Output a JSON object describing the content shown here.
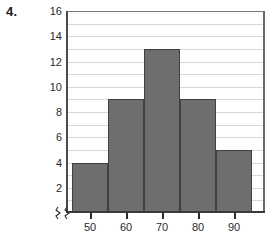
{
  "problem": {
    "number": "4."
  },
  "chart_data": {
    "type": "bar",
    "title": "",
    "xlabel": "",
    "ylabel": "",
    "categories": [
      "50",
      "60",
      "70",
      "80",
      "90"
    ],
    "values": [
      4,
      9,
      13,
      9,
      5
    ],
    "ylim": [
      0,
      16
    ],
    "y_ticks": [
      16,
      14,
      12,
      10,
      8,
      6,
      4,
      2
    ],
    "y_tick_labels": [
      "16",
      "14",
      "12",
      "10",
      "8",
      "6",
      "4",
      "2"
    ],
    "x_tick_labels": [
      "50",
      "60",
      "70",
      "80",
      "90"
    ],
    "grid": true,
    "grid_interval": 1,
    "legend": "none",
    "bar_color": "#6e6e6e",
    "bar_edge_color": "#3f3f3f",
    "grid_color": "#d8d8d8",
    "axis_color": "#3a3a3a",
    "axis_break": true,
    "bars": [
      {
        "label": "50",
        "value": 4
      },
      {
        "label": "60",
        "value": 9
      },
      {
        "label": "70",
        "value": 13
      },
      {
        "label": "80",
        "value": 9
      },
      {
        "label": "90",
        "value": 5
      }
    ]
  }
}
